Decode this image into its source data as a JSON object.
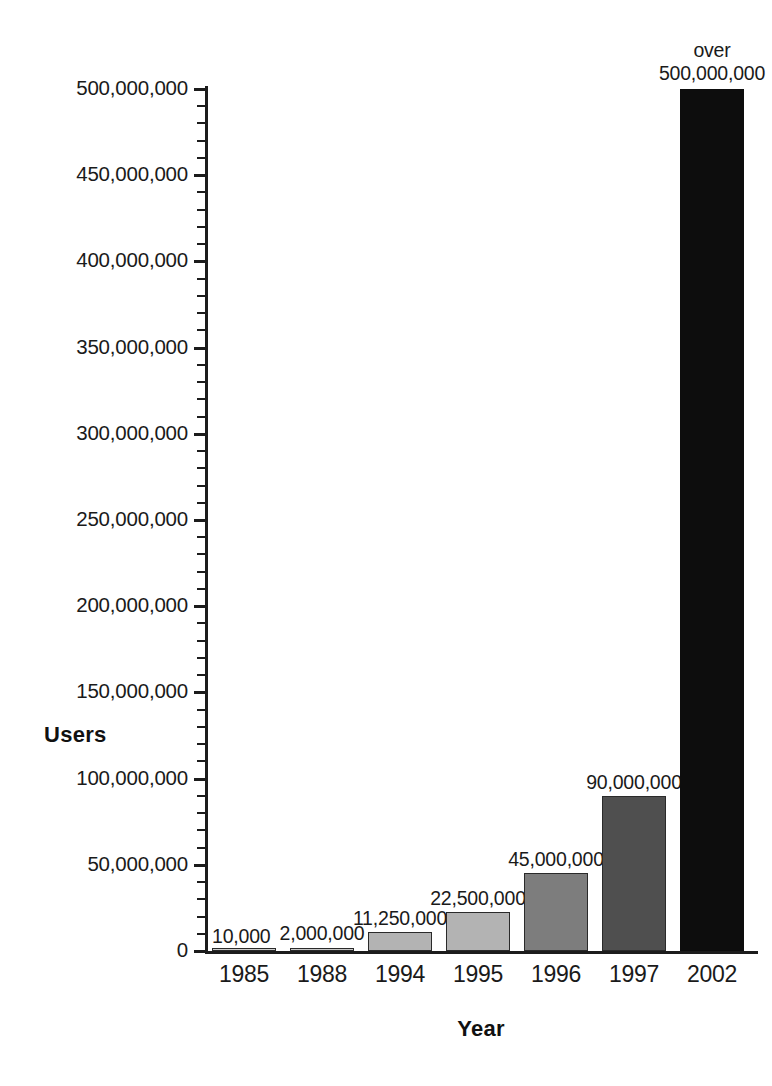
{
  "chart_data": {
    "type": "bar",
    "title": "",
    "xlabel": "Year",
    "ylabel": "Users",
    "categories": [
      "1985",
      "1988",
      "1994",
      "1995",
      "1996",
      "1997",
      "2002"
    ],
    "values": [
      10000,
      2000000,
      11250000,
      22500000,
      45000000,
      90000000,
      500000000
    ],
    "data_labels": [
      "10,000",
      "2,000,000",
      "11,250,000",
      "22,500,000",
      "45,000,000",
      "90,000,000",
      "over 500,000,000"
    ],
    "bar_colors": [
      "#cfcfcf",
      "#c9c9c9",
      "#b3b3b3",
      "#b3b3b3",
      "#7d7d7d",
      "#4f4f4f",
      "#0d0d0d"
    ],
    "ylim": [
      0,
      500000000
    ],
    "ytick_values": [
      0,
      50000000,
      100000000,
      150000000,
      200000000,
      250000000,
      300000000,
      350000000,
      400000000,
      450000000,
      500000000
    ],
    "ytick_labels": [
      "0",
      "50,000,000",
      "100,000,000",
      "150,000,000",
      "200,000,000",
      "250,000,000",
      "300,000,000",
      "350,000,000",
      "400,000,000",
      "450,000,000",
      "500,000,000"
    ],
    "minor_ticks_between_majors": 4,
    "grid": false,
    "legend": false
  },
  "axis": {
    "y_title": "Users",
    "x_title": "Year"
  },
  "bars": [
    {
      "category": "1985",
      "value": 10000,
      "label": "10,000",
      "label_prefix": "",
      "color": "#cfcfcf",
      "outlined": true
    },
    {
      "category": "1988",
      "value": 2000000,
      "label": "2,000,000",
      "label_prefix": "",
      "color": "#c9c9c9",
      "outlined": true
    },
    {
      "category": "1994",
      "value": 11250000,
      "label": "11,250,000",
      "label_prefix": "",
      "color": "#b3b3b3",
      "outlined": true
    },
    {
      "category": "1995",
      "value": 22500000,
      "label": "22,500,000",
      "label_prefix": "",
      "color": "#b3b3b3",
      "outlined": true
    },
    {
      "category": "1996",
      "value": 45000000,
      "label": "45,000,000",
      "label_prefix": "",
      "color": "#7d7d7d",
      "outlined": true
    },
    {
      "category": "1997",
      "value": 90000000,
      "label": "90,000,000",
      "label_prefix": "",
      "color": "#4f4f4f",
      "outlined": true
    },
    {
      "category": "2002",
      "value": 500000000,
      "label": "500,000,000",
      "label_prefix": "over",
      "color": "#0d0d0d",
      "outlined": false
    }
  ],
  "ytick_labels": [
    "0",
    "50,000,000",
    "100,000,000",
    "150,000,000",
    "200,000,000",
    "250,000,000",
    "300,000,000",
    "350,000,000",
    "400,000,000",
    "450,000,000",
    "500,000,000"
  ]
}
